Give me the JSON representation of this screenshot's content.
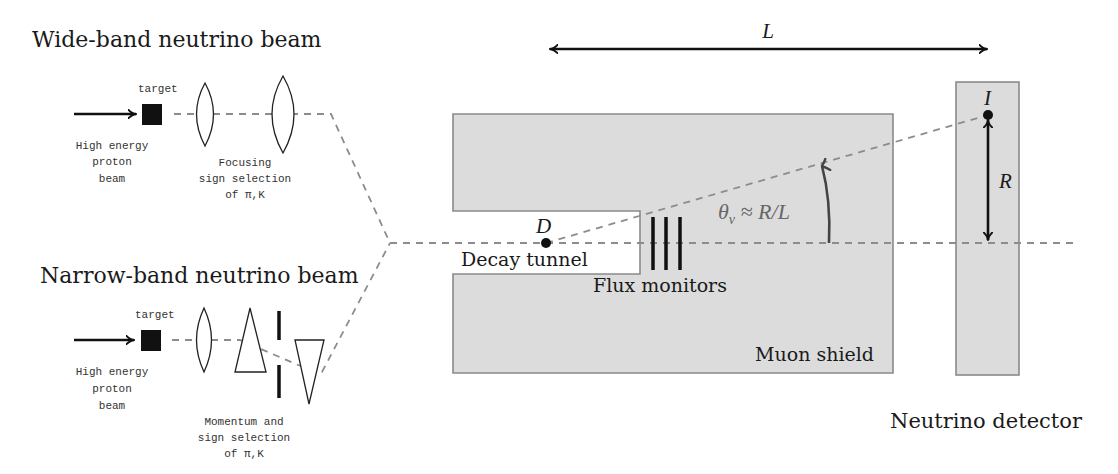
{
  "diagram": {
    "wide_band": {
      "title": "Wide-band neutrino beam",
      "target_label": "target",
      "proton_beam_label": [
        "High energy",
        "proton",
        "beam"
      ],
      "optics_label": [
        "Focusing",
        "sign selection",
        "of π,K"
      ]
    },
    "narrow_band": {
      "title": "Narrow-band neutrino beam",
      "target_label": "target",
      "proton_beam_label": [
        "High energy",
        "proton",
        "beam"
      ],
      "optics_label": [
        "Momentum and",
        "sign selection",
        "of π,K"
      ]
    },
    "main": {
      "length_label": "L",
      "decay_point_label": "D",
      "decay_tunnel_label": "Decay tunnel",
      "flux_monitors_label": "Flux monitors",
      "angle_label": "θν ≈ R/L",
      "angle_symbol": "θ",
      "angle_subscript": "ν",
      "angle_rest": " ≈ R/L",
      "muon_shield_label": "Muon shield",
      "interaction_point_label": "I",
      "radius_label": "R",
      "detector_label": "Neutrino detector"
    },
    "colors": {
      "shield_fill": "#dcdcdc",
      "shield_stroke": "#8a8a8a",
      "dashed_beam": "#8c8c8c",
      "ink": "#111111"
    }
  }
}
